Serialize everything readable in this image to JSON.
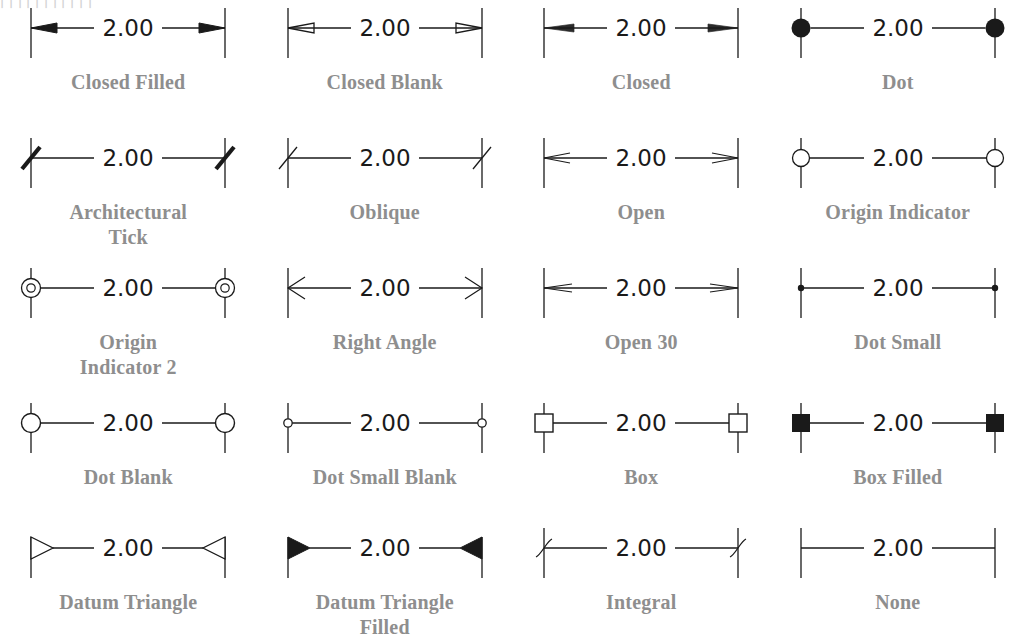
{
  "page": {
    "background_color": "#ffffff",
    "line_color": "#1a1a1a",
    "label_color": "#8e8e8e",
    "scan_artifact_text": "ꞁ      ꞁ          ꞁ      ꞁ        ꞁ     ꞁ       ꞁ      ꞁ        ꞁ    ꞁ     ꞁ"
  },
  "dimension_value": "2.00",
  "columns": 4,
  "rows": 5,
  "cells": [
    {
      "id": "closed-filled",
      "label": "Closed Filled",
      "terminator": "closed-filled",
      "row": 1,
      "col": 1
    },
    {
      "id": "closed-blank",
      "label": "Closed Blank",
      "terminator": "closed-blank",
      "row": 1,
      "col": 2
    },
    {
      "id": "closed",
      "label": "Closed",
      "terminator": "closed",
      "row": 1,
      "col": 3
    },
    {
      "id": "dot",
      "label": "Dot",
      "terminator": "dot",
      "row": 1,
      "col": 4
    },
    {
      "id": "architectural-tick",
      "label": "Architectural\nTick",
      "terminator": "architectural-tick",
      "row": 2,
      "col": 1
    },
    {
      "id": "oblique",
      "label": "Oblique",
      "terminator": "oblique",
      "row": 2,
      "col": 2
    },
    {
      "id": "open",
      "label": "Open",
      "terminator": "open",
      "row": 2,
      "col": 3
    },
    {
      "id": "origin-indicator",
      "label": "Origin Indicator",
      "terminator": "origin-indicator",
      "row": 2,
      "col": 4
    },
    {
      "id": "origin-indicator-2",
      "label": "Origin\nIndicator 2",
      "terminator": "origin-indicator-2",
      "row": 3,
      "col": 1
    },
    {
      "id": "right-angle",
      "label": "Right Angle",
      "terminator": "right-angle",
      "row": 3,
      "col": 2
    },
    {
      "id": "open-30",
      "label": "Open 30",
      "terminator": "open-30",
      "row": 3,
      "col": 3
    },
    {
      "id": "dot-small",
      "label": "Dot Small",
      "terminator": "dot-small",
      "row": 3,
      "col": 4
    },
    {
      "id": "dot-blank",
      "label": "Dot Blank",
      "terminator": "dot-blank",
      "row": 4,
      "col": 1
    },
    {
      "id": "dot-small-blank",
      "label": "Dot Small Blank",
      "terminator": "dot-small-blank",
      "row": 4,
      "col": 2
    },
    {
      "id": "box",
      "label": "Box",
      "terminator": "box",
      "row": 4,
      "col": 3
    },
    {
      "id": "box-filled",
      "label": "Box Filled",
      "terminator": "box-filled",
      "row": 4,
      "col": 4
    },
    {
      "id": "datum-triangle",
      "label": "Datum Triangle",
      "terminator": "datum-triangle",
      "row": 5,
      "col": 1
    },
    {
      "id": "datum-triangle-filled",
      "label": "Datum Triangle\nFilled",
      "terminator": "datum-triangle-filled",
      "row": 5,
      "col": 2
    },
    {
      "id": "integral",
      "label": "Integral",
      "terminator": "integral",
      "row": 5,
      "col": 3
    },
    {
      "id": "none",
      "label": "None",
      "terminator": "none",
      "row": 5,
      "col": 4
    }
  ]
}
